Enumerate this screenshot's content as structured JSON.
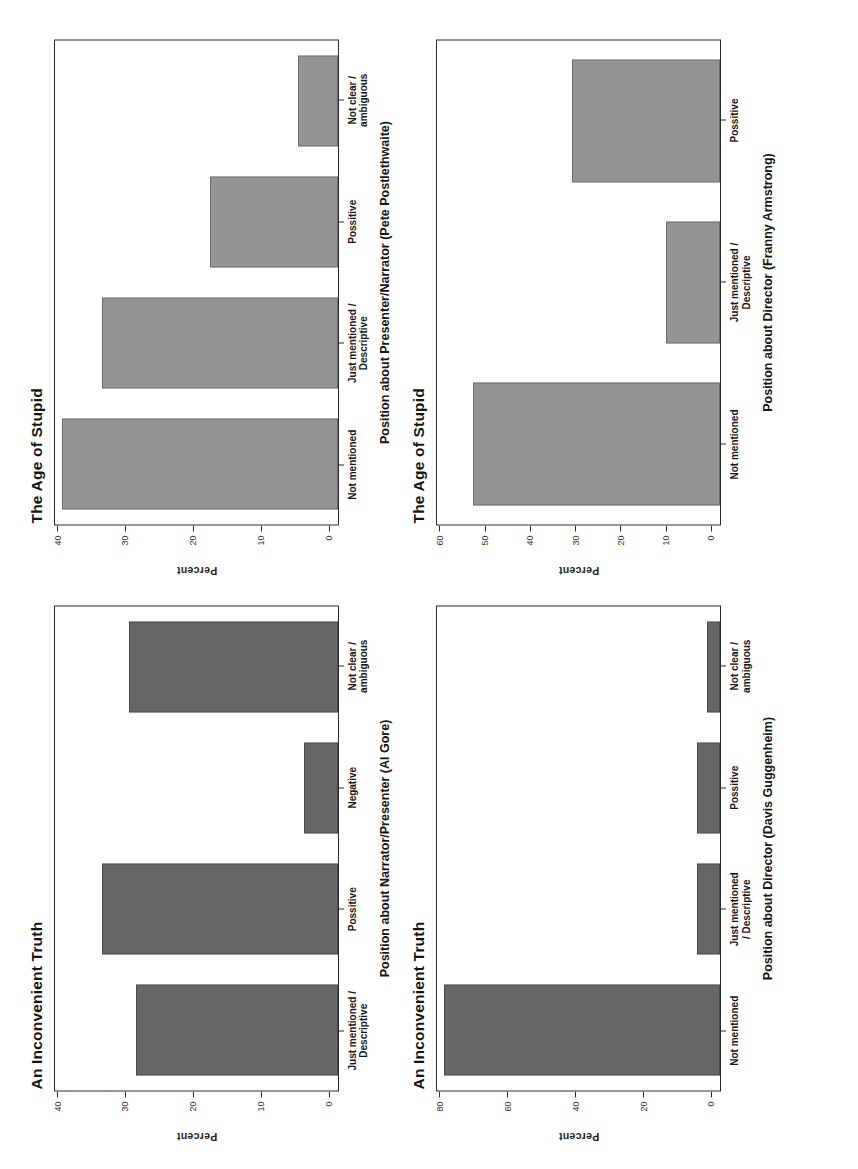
{
  "page": {
    "orientation": "rotated-90",
    "background": "#ffffff",
    "axis_color": "#2a2a2a"
  },
  "colors": {
    "dark_bar": "#666666",
    "light_bar": "#949494",
    "text": "#161616"
  },
  "chart_data": [
    {
      "type": "bar",
      "id": "inconvenient-truth-narrator",
      "title": "An Inconvenient Truth",
      "xlabel": "Position about Narrator/Presenter (Al Gore)",
      "ylabel": "Percent",
      "categories": [
        "Just mentioned /\nDescriptive",
        "Possitive",
        "Negative",
        "Not clear /\nambiguous"
      ],
      "values": [
        30,
        35,
        5,
        31
      ],
      "ylim": [
        0,
        42
      ],
      "yticks": [
        0,
        10,
        20,
        30,
        40
      ],
      "bar_color": "#666666",
      "grid": false,
      "legend": "none"
    },
    {
      "type": "bar",
      "id": "age-of-stupid-presenter",
      "title": "The Age of Stupid",
      "xlabel": "Position about Presenter/Narrator (Pete Postlethwaite)",
      "ylabel": "Percent",
      "categories": [
        "Not mentioned",
        "Just mentioned /\nDescriptive",
        "Possitive",
        "Not clear /\nambiguous"
      ],
      "values": [
        41,
        35,
        19,
        6
      ],
      "ylim": [
        0,
        42
      ],
      "yticks": [
        0,
        10,
        20,
        30,
        40
      ],
      "bar_color": "#949494",
      "grid": false,
      "legend": "none"
    },
    {
      "type": "bar",
      "id": "inconvenient-truth-director",
      "title": "An Inconvenient Truth",
      "xlabel": "Position about Director (Davis Guggenheim)",
      "ylabel": "Percent",
      "categories": [
        "Not mentioned",
        "Just mentioned\n/ Descriptive",
        "Possitive",
        "Not clear /\nambiguous"
      ],
      "values": [
        82,
        7,
        7,
        4
      ],
      "ylim": [
        0,
        84
      ],
      "yticks": [
        0,
        20,
        40,
        60,
        80
      ],
      "bar_color": "#666666",
      "grid": false,
      "legend": "none"
    },
    {
      "type": "bar",
      "id": "age-of-stupid-director",
      "title": "The Age of Stupid",
      "xlabel": "Position about Director (Franny Armstrong)",
      "ylabel": "Percent",
      "categories": [
        "Not mentioned",
        "Just mentioned /\nDescriptive",
        "Possitive"
      ],
      "values": [
        55,
        12,
        33
      ],
      "ylim": [
        0,
        63
      ],
      "yticks": [
        0,
        10,
        20,
        30,
        40,
        50,
        60
      ],
      "bar_color": "#949494",
      "grid": false,
      "legend": "none"
    }
  ]
}
